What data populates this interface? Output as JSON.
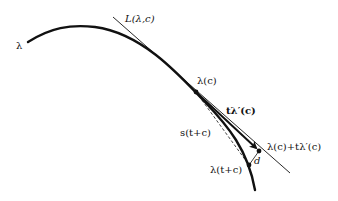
{
  "diagram": {
    "labels": {
      "curve": "λ",
      "tangent_line": "L(λ,c)",
      "point_on_curve": "λ(c)",
      "tangent_vector": "tλ′(c)",
      "secant": "s(t+c)",
      "tangent_point": "λ(c)+tλ′(c)",
      "curve_point": "λ(t+c)",
      "distance": "d"
    },
    "colors": {
      "stroke": "#111111",
      "background": "#ffffff"
    }
  }
}
